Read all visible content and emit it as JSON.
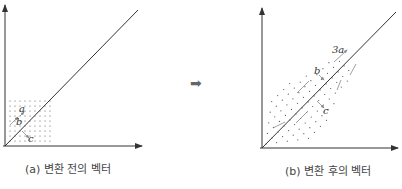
{
  "figure": {
    "left_panel": {
      "caption": "(a) 변환 전의 벡터",
      "vectors": [
        "a",
        "b",
        "c"
      ],
      "grid": {
        "cols": 9,
        "rows": 9
      }
    },
    "arrow": "➡",
    "right_panel": {
      "caption": "(b) 변환 후의 벡터",
      "vectors": [
        "3a",
        "b",
        "c"
      ]
    },
    "colors": {
      "axis": "#333333",
      "dots": "#555555",
      "vector": "#888888",
      "arrow": "#666666"
    }
  }
}
